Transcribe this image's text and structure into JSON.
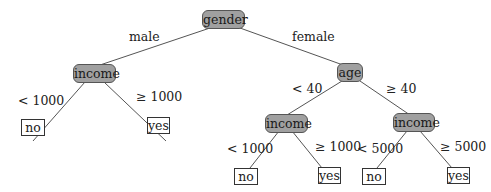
{
  "tree": {
    "root": {
      "label": "gender"
    },
    "edges": {
      "male": "male",
      "female": "female",
      "lt1000_a": "< 1000",
      "ge1000_a": "≥ 1000",
      "lt40": "< 40",
      "ge40": "≥ 40",
      "lt1000_b": "< 1000",
      "ge1000_b": "≥ 1000",
      "lt5000": "< 5000",
      "ge5000": "≥ 5000"
    },
    "nodes": {
      "income_male": "income",
      "age": "age",
      "income_young": "income",
      "income_old": "income"
    },
    "leaves": {
      "male_low": "no",
      "male_high": "yes",
      "young_low": "no",
      "young_high": "yes",
      "old_low": "no",
      "old_high": "yes"
    }
  },
  "colors": {
    "node_fill": "#a0a0a0",
    "edge": "#555555",
    "leaf_fill": "#ffffff"
  }
}
